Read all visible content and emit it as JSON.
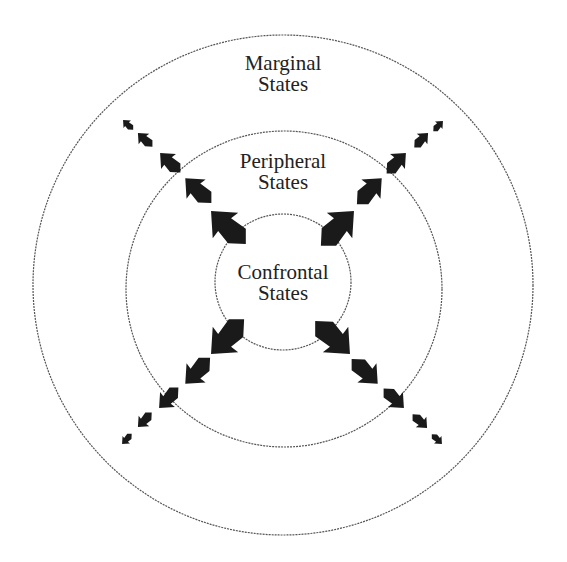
{
  "diagram": {
    "type": "concentric-circles",
    "rings": [
      {
        "name": "Confrontal States",
        "line1": "Confrontal",
        "line2": "States",
        "cx": 283,
        "cy": 282,
        "r": 68
      },
      {
        "name": "Peripheral States",
        "line1": "Peripheral",
        "line2": "States",
        "cx": 284,
        "cy": 289,
        "r": 158
      },
      {
        "name": "Marginal States",
        "line1": "Marginal",
        "line2": "States",
        "cx": 283,
        "cy": 285,
        "r": 250
      }
    ],
    "arrow_color": "#1a1a1a",
    "ring_color": "#555555",
    "arrow_directions": [
      "north-west",
      "north-east",
      "south-west",
      "south-east"
    ],
    "arrows_per_direction": 5
  }
}
